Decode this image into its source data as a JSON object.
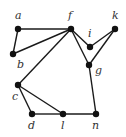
{
  "graph": {
    "nodes": [
      {
        "id": "a",
        "label": "a",
        "x": 18,
        "y": 29,
        "lx": 15,
        "ly": 19
      },
      {
        "id": "b",
        "label": "b",
        "x": 13,
        "y": 54,
        "lx": 17,
        "ly": 68
      },
      {
        "id": "f",
        "label": "f",
        "x": 71,
        "y": 29,
        "lx": 68,
        "ly": 19
      },
      {
        "id": "i",
        "label": "i",
        "x": 90,
        "y": 47,
        "lx": 88,
        "ly": 37
      },
      {
        "id": "k",
        "label": "k",
        "x": 115,
        "y": 29,
        "lx": 112,
        "ly": 19
      },
      {
        "id": "g",
        "label": "g",
        "x": 89,
        "y": 65,
        "lx": 95,
        "ly": 74
      },
      {
        "id": "c",
        "label": "c",
        "x": 18,
        "y": 85,
        "lx": 12,
        "ly": 100
      },
      {
        "id": "d",
        "label": "d",
        "x": 32,
        "y": 114,
        "lx": 28,
        "ly": 129
      },
      {
        "id": "l",
        "label": "l",
        "x": 63,
        "y": 114,
        "lx": 61,
        "ly": 129
      },
      {
        "id": "n",
        "label": "n",
        "x": 96,
        "y": 114,
        "lx": 92,
        "ly": 129
      }
    ],
    "edges": [
      [
        "a",
        "f"
      ],
      [
        "a",
        "b"
      ],
      [
        "b",
        "f"
      ],
      [
        "f",
        "c"
      ],
      [
        "f",
        "i"
      ],
      [
        "f",
        "g"
      ],
      [
        "i",
        "k"
      ],
      [
        "k",
        "g"
      ],
      [
        "g",
        "n"
      ],
      [
        "c",
        "d"
      ],
      [
        "c",
        "l"
      ],
      [
        "d",
        "l"
      ],
      [
        "l",
        "n"
      ]
    ]
  }
}
